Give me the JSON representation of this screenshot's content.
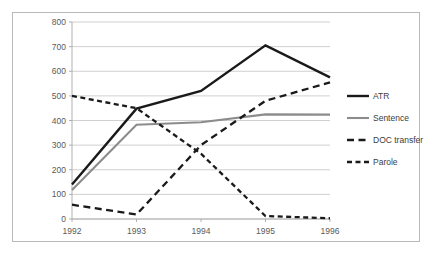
{
  "chart_data": {
    "type": "line",
    "title": "",
    "xlabel": "",
    "ylabel": "",
    "x": [
      "1992",
      "1993",
      "1994",
      "1995",
      "1996"
    ],
    "categories": [
      "1992",
      "1993",
      "1994",
      "1995",
      "1996"
    ],
    "xlim": [
      1992,
      1996
    ],
    "ylim": [
      0,
      800
    ],
    "y_ticks": [
      "0",
      "100",
      "200",
      "300",
      "400",
      "500",
      "600",
      "700",
      "800"
    ],
    "y_tick_values": [
      0,
      100,
      200,
      300,
      400,
      500,
      600,
      700,
      800
    ],
    "grid": "horizontal",
    "legend_position": "right",
    "series": [
      {
        "name": "ATR",
        "values": [
          140,
          448,
          520,
          705,
          575
        ],
        "color": "#1a1a1a",
        "style": "solid",
        "width": 2.4
      },
      {
        "name": "Sentence",
        "values": [
          118,
          383,
          393,
          425,
          424
        ],
        "color": "#8c8c8c",
        "style": "solid",
        "width": 2.1
      },
      {
        "name": "DOC transfer",
        "values": [
          58,
          18,
          300,
          480,
          555
        ],
        "color": "#1a1a1a",
        "style": "long-dash",
        "width": 2.3
      },
      {
        "name": "Parole",
        "values": [
          500,
          450,
          265,
          12,
          3
        ],
        "color": "#1a1a1a",
        "style": "short-dash",
        "width": 2.3
      }
    ]
  },
  "axes": {
    "y_labels": [
      {
        "text": "800",
        "value": 800
      },
      {
        "text": "700",
        "value": 700
      },
      {
        "text": "600",
        "value": 600
      },
      {
        "text": "500",
        "value": 500
      },
      {
        "text": "400",
        "value": 400
      },
      {
        "text": "300",
        "value": 300
      },
      {
        "text": "200",
        "value": 200
      },
      {
        "text": "100",
        "value": 100
      },
      {
        "text": "0",
        "value": 0
      }
    ],
    "x_labels": [
      {
        "text": "1992",
        "value": 1992
      },
      {
        "text": "1993",
        "value": 1993
      },
      {
        "text": "1994",
        "value": 1994
      },
      {
        "text": "1995",
        "value": 1995
      },
      {
        "text": "1996",
        "value": 1996
      }
    ]
  },
  "legend": {
    "items": [
      {
        "label": "ATR",
        "color": "#1a1a1a",
        "style": "solid"
      },
      {
        "label": "Sentence",
        "color": "#8c8c8c",
        "style": "solid"
      },
      {
        "label": "DOC transfer",
        "color": "#1a1a1a",
        "style": "long-dash"
      },
      {
        "label": "Parole",
        "color": "#1a1a1a",
        "style": "short-dash"
      }
    ]
  },
  "colors": {
    "background": "#ffffff",
    "frame_border": "#b9b9b9",
    "gridline": "#c4c4c4",
    "axis": "#a8a8a8",
    "tick_text": "#5a5a5a",
    "legend_text": "#3d3d3d"
  }
}
